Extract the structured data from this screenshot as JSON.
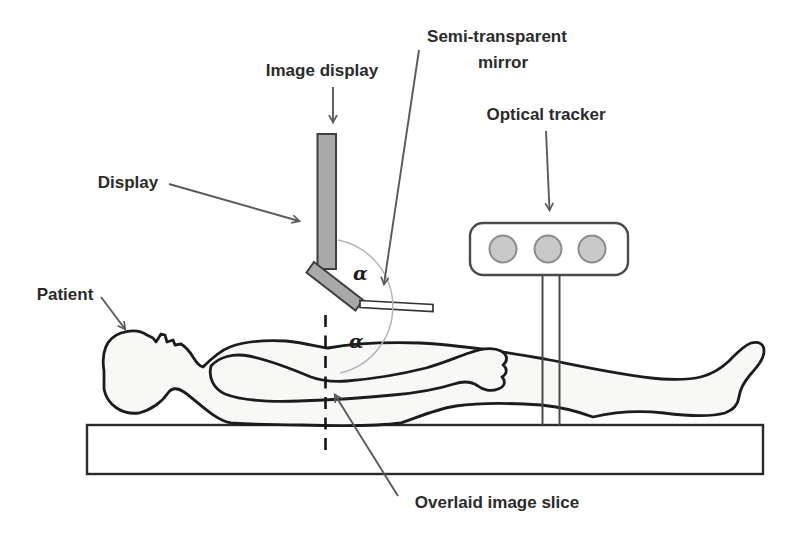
{
  "diagram": {
    "title_context": "Augmented-reality image overlay setup diagram",
    "labels": {
      "image_display": "Image display",
      "semi_transparent_mirror_line1": "Semi-transparent",
      "semi_transparent_mirror_line2": "mirror",
      "optical_tracker": "Optical tracker",
      "display": "Display",
      "patient": "Patient",
      "overlaid_image_slice": "Overlaid image slice",
      "alpha_upper": "α",
      "alpha_lower": "α"
    },
    "colors": {
      "background": "#ffffff",
      "outline": "#1c1c1c",
      "device_fill": "#a9a9a9",
      "device_stroke": "#3f3f3f",
      "body_fill": "#f8f8f7",
      "tracker_marker_fill": "#c9c9c9",
      "tracker_marker_stroke": "#8c8c8c",
      "arrow": "#5a5a5a",
      "angle_arc": "#b5b5b5",
      "label_text": "#2b2b2b"
    }
  }
}
